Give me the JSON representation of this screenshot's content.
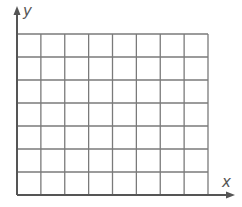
{
  "diagram": {
    "type": "coordinate-grid",
    "axes": {
      "x_label": "x",
      "y_label": "y"
    },
    "grid": {
      "columns": 8,
      "rows": 7,
      "line_color": "#7a7a7a",
      "axis_color": "#555555"
    }
  }
}
